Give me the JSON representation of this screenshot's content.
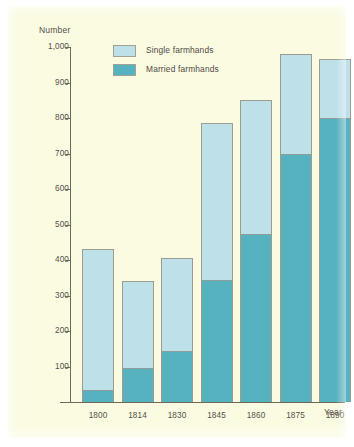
{
  "figure": {
    "background_color": "#fbfbe2",
    "page_color": "#ffffff"
  },
  "axes": {
    "y_title": "Number",
    "x_title": "Year",
    "y_ticks": [
      "1,000",
      "900",
      "800",
      "700",
      "600",
      "500",
      "400",
      "300",
      "200",
      "100"
    ],
    "x_ticks": [
      "1800",
      "1814",
      "1830",
      "1845",
      "1860",
      "1875",
      "1890"
    ]
  },
  "legend": {
    "items": [
      {
        "label": "Single farmhands",
        "color": "#bde0e9"
      },
      {
        "label": "Married farmhands",
        "color": "#56b2be"
      }
    ]
  },
  "chart_data": {
    "type": "bar",
    "stacked": true,
    "title": "",
    "subtitle": "",
    "xlabel": "Year",
    "ylabel": "Number",
    "ylim": [
      0,
      1000
    ],
    "ytick_values": [
      100,
      200,
      300,
      400,
      500,
      600,
      700,
      800,
      900,
      1000
    ],
    "grid": false,
    "legend_position": "top-left-inside",
    "categories": [
      "1800",
      "1814",
      "1830",
      "1845",
      "1860",
      "1875",
      "1890"
    ],
    "series": [
      {
        "name": "Married farmhands",
        "color": "#56b2be",
        "values": [
          35,
          97,
          145,
          345,
          473,
          700,
          800
        ]
      },
      {
        "name": "Single farmhands",
        "color": "#bde0e9",
        "values": [
          395,
          243,
          260,
          440,
          377,
          280,
          165
        ]
      }
    ],
    "totals": [
      430,
      340,
      405,
      785,
      850,
      980,
      965
    ]
  }
}
